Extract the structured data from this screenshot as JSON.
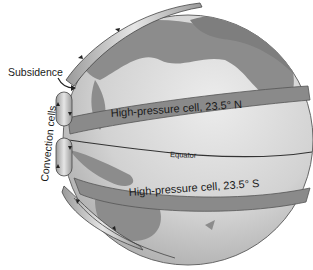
{
  "labels": {
    "subsidence": "Subsidence",
    "convection_cells": "Convection cells",
    "high_pressure_north": "High-pressure cell, 23.5° N",
    "equator": "Equator",
    "high_pressure_south": "High-pressure cell, 23.5° S"
  },
  "colors": {
    "ocean": "#d4d4d4",
    "land": "#8a8a8a",
    "band": "#7a7a7a",
    "cell": "#b8b8b8",
    "outline": "#333333"
  }
}
